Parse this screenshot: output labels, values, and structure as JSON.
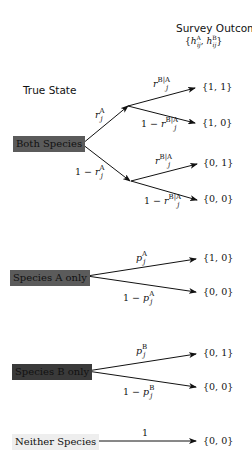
{
  "header": {
    "survey_outcome": "Survey Outcome",
    "survey_outcome_sub": "{h^A_ij, h^B_ij}",
    "survey_outcome_sub_parts": {
      "h": "h",
      "a": "A",
      "b": "B",
      "ij": "ij"
    },
    "true_state": "True State"
  },
  "states": [
    {
      "label": "Both Species",
      "fill": "#5b5b5b"
    },
    {
      "label": "Species A only",
      "fill": "#5b5b5b"
    },
    {
      "label": "Species B only",
      "fill": "#3a3a3a"
    },
    {
      "label": "Neither Species",
      "fill": "#eeeeee"
    }
  ],
  "edges": {
    "rA": {
      "pre": "",
      "sym": "r",
      "sup": "A",
      "sub": "j"
    },
    "one_minus_rA": {
      "pre": "1 − ",
      "sym": "r",
      "sup": "A",
      "sub": "j"
    },
    "rBA_1": {
      "pre": "",
      "sym": "r",
      "sup": "B|A",
      "sub": "j"
    },
    "one_minus_rBA_1": {
      "pre": "1 − ",
      "sym": "r",
      "sup": "B|A",
      "sub": "j"
    },
    "rBA_2": {
      "pre": "",
      "sym": "r",
      "sup": "B|A",
      "sub": "j"
    },
    "one_minus_rBA_2": {
      "pre": "1 − ",
      "sym": "r",
      "sup": "B|A",
      "sub": "j"
    },
    "pA": {
      "pre": "",
      "sym": "p",
      "sup": "A",
      "sub": "j"
    },
    "one_minus_pA": {
      "pre": "1 − ",
      "sym": "p",
      "sup": "A",
      "sub": "j"
    },
    "pB": {
      "pre": "",
      "sym": "p",
      "sup": "B",
      "sub": "j"
    },
    "one_minus_pB": {
      "pre": "1 − ",
      "sym": "p",
      "sup": "B",
      "sub": "j"
    },
    "one": {
      "pre": "1"
    }
  },
  "outcomes": [
    "{1, 1}",
    "{1, 0}",
    "{0, 1}",
    "{0, 0}",
    "{1, 0}",
    "{0, 0}",
    "{0, 1}",
    "{0, 0}",
    "{0, 0}"
  ]
}
